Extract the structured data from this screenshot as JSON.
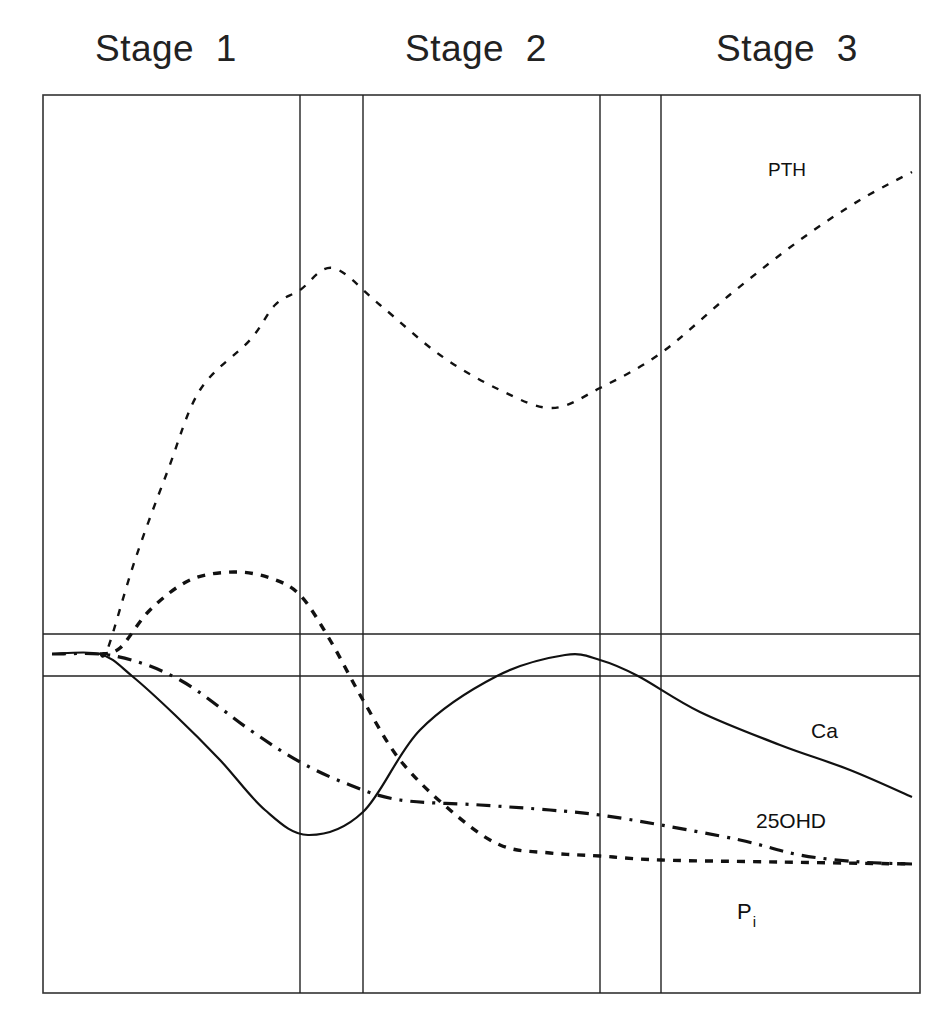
{
  "stages": [
    {
      "label": "Stage  1",
      "x": 95
    },
    {
      "label": "Stage  2",
      "x": 405
    },
    {
      "label": "Stage  3",
      "x": 716
    }
  ],
  "chart_data": {
    "type": "line",
    "title": "",
    "xlabel": "",
    "ylabel": "",
    "stage_labels": [
      "Stage 1",
      "Stage 2",
      "Stage 3"
    ],
    "frame": {
      "left": 43,
      "top": 95,
      "right": 920,
      "bottom": 993
    },
    "vertical_dividers_px": [
      300,
      363,
      600,
      661
    ],
    "normal_range_band_px": [
      634,
      676
    ],
    "grid": false,
    "legend": "inline labels",
    "series": [
      {
        "name": "PTH",
        "style": "dashed",
        "points_px": [
          [
            100,
            654
          ],
          [
            108,
            648
          ],
          [
            135,
            560
          ],
          [
            168,
            470
          ],
          [
            200,
            390
          ],
          [
            250,
            340
          ],
          [
            275,
            305
          ],
          [
            300,
            290
          ],
          [
            333,
            268
          ],
          [
            380,
            305
          ],
          [
            440,
            355
          ],
          [
            500,
            390
          ],
          [
            552,
            408
          ],
          [
            600,
            388
          ],
          [
            661,
            353
          ],
          [
            732,
            293
          ],
          [
            800,
            240
          ],
          [
            860,
            200
          ],
          [
            912,
            172
          ]
        ]
      },
      {
        "name": "Ca",
        "style": "solid",
        "points_px": [
          [
            52,
            654
          ],
          [
            100,
            654
          ],
          [
            132,
            676
          ],
          [
            175,
            715
          ],
          [
            220,
            760
          ],
          [
            265,
            810
          ],
          [
            308,
            835
          ],
          [
            363,
            812
          ],
          [
            420,
            730
          ],
          [
            497,
            676
          ],
          [
            565,
            655
          ],
          [
            600,
            660
          ],
          [
            638,
            676
          ],
          [
            700,
            712
          ],
          [
            780,
            745
          ],
          [
            850,
            770
          ],
          [
            912,
            797
          ]
        ]
      },
      {
        "name": "25OHD",
        "style": "dash-dot",
        "points_px": [
          [
            52,
            654
          ],
          [
            115,
            656
          ],
          [
            180,
            680
          ],
          [
            250,
            730
          ],
          [
            300,
            762
          ],
          [
            350,
            785
          ],
          [
            400,
            800
          ],
          [
            480,
            805
          ],
          [
            550,
            810
          ],
          [
            600,
            815
          ],
          [
            661,
            825
          ],
          [
            740,
            840
          ],
          [
            800,
            855
          ],
          [
            860,
            862
          ],
          [
            912,
            864
          ]
        ]
      },
      {
        "name": "Pi",
        "style": "dotted-dash",
        "points_px": [
          [
            100,
            654
          ],
          [
            120,
            648
          ],
          [
            150,
            610
          ],
          [
            190,
            580
          ],
          [
            234,
            572
          ],
          [
            270,
            578
          ],
          [
            300,
            595
          ],
          [
            330,
            640
          ],
          [
            363,
            700
          ],
          [
            400,
            760
          ],
          [
            450,
            810
          ],
          [
            500,
            845
          ],
          [
            550,
            853
          ],
          [
            600,
            856
          ],
          [
            661,
            860
          ],
          [
            780,
            862
          ],
          [
            912,
            864
          ]
        ]
      }
    ]
  },
  "labels": {
    "pth": {
      "text": "PTH",
      "x": 768,
      "y": 176
    },
    "ca": {
      "text": "Ca",
      "x": 811,
      "y": 738
    },
    "ohd": {
      "text": "25OHD",
      "x": 756,
      "y": 828
    },
    "pi": {
      "text": "P",
      "sub": "i",
      "x": 737,
      "y": 919
    }
  }
}
